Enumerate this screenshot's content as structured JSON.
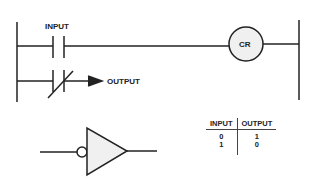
{
  "ladder": {
    "input_label": "INPUT",
    "output_label": "OUTPUT",
    "coil_label": "CR"
  },
  "truth_table": {
    "headers": [
      "INPUT",
      "OUTPUT"
    ],
    "rows": [
      [
        "0",
        "1"
      ],
      [
        "1",
        "0"
      ]
    ]
  },
  "colors": {
    "line": "#222222",
    "fill": "#f0f0f0"
  }
}
